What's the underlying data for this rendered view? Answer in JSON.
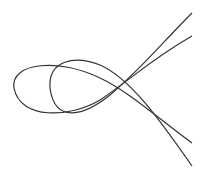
{
  "figure": {
    "curves": [
      {
        "name": "curve-left-loop",
        "d": "M192,36 C150,60 130,80 100,100 C70,118 20,120 14,88 C10,62 60,58 100,78 C130,92 160,120 192,143"
      },
      {
        "name": "curve-right-loop",
        "d": "M192,13 C160,45 140,70 110,95 C85,115 55,125 50,88 C48,60 75,55 100,65 C130,78 160,120 192,166"
      }
    ],
    "stroke_color": "#333333"
  }
}
